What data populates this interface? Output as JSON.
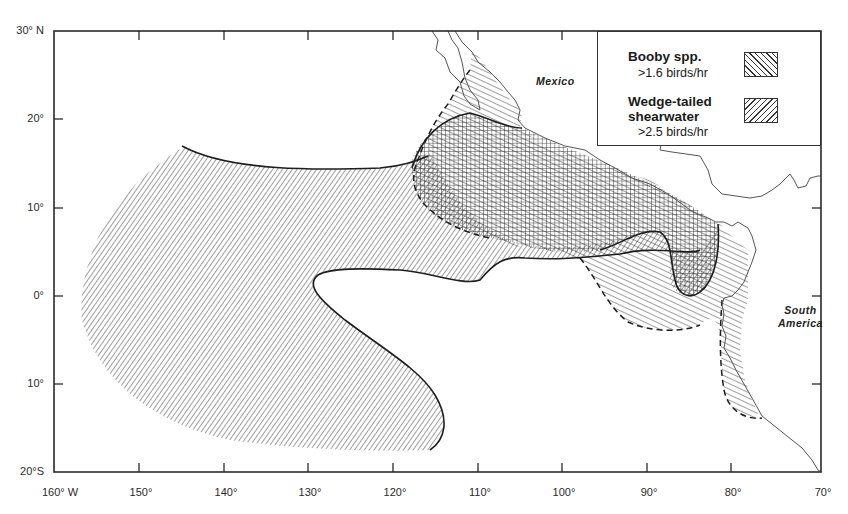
{
  "map": {
    "title": "Booby and Wedge-tailed shearwater distribution, eastern tropical Pacific",
    "frame": {
      "lon_min": "160°W",
      "lon_max": "70°W",
      "lat_min": "20°S",
      "lat_max": "30°N"
    },
    "lat_labels": [
      "30° N",
      "20°",
      "10°",
      "0°",
      "10°",
      "20°S"
    ],
    "lon_labels": [
      "160° W",
      "150°",
      "140°",
      "130°",
      "120°",
      "110°",
      "100°",
      "90°",
      "80°",
      "70°"
    ],
    "regions": {
      "mexico": "Mexico",
      "south_america_line1": "South",
      "south_america_line2": "America"
    },
    "colors": {
      "ink": "#2a2a2a",
      "background": "#ffffff",
      "coast": "#555555"
    }
  },
  "legend": {
    "items": [
      {
        "title": "Booby spp.",
        "threshold": ">1.6 birds/hr",
        "pattern": "diagonal-down-right hatch"
      },
      {
        "title_line1": "Wedge-tailed",
        "title_line2": "shearwater",
        "threshold": ">2.5 birds/hr",
        "pattern": "diagonal-up-right hatch"
      }
    ]
  }
}
